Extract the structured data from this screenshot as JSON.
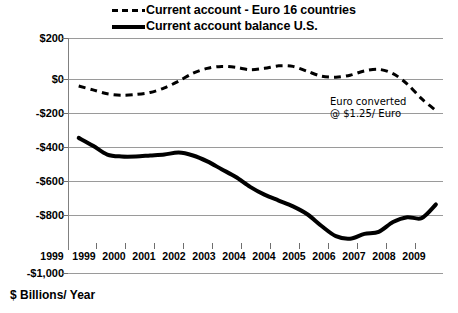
{
  "legend": {
    "items": [
      {
        "label": "Current account - Euro 16 countries",
        "marker": "dashed-line-icon"
      },
      {
        "label": "Current account balance U.S.",
        "marker": "solid-line-icon"
      }
    ]
  },
  "annotation": {
    "line1": "Euro converted",
    "line2": "@ $1.25/ Euro"
  },
  "footer_label": "$ Billions/ Year",
  "axis": {
    "y_ticks": [
      "$200",
      "$0",
      "-$200",
      "-$400",
      "-$600",
      "-$800",
      "-$1,000"
    ],
    "x_ticks": [
      "1999",
      "1999",
      "2000",
      "2001",
      "2002",
      "2003",
      "2004",
      "2004",
      "2005",
      "2006",
      "2007",
      "2008",
      "2009"
    ]
  },
  "colors": {
    "line": "#000000",
    "grid": "#9a9a9a",
    "background": "#ffffff"
  },
  "chart_data": {
    "type": "line",
    "title": "",
    "subtitle": "",
    "xlabel": "",
    "ylabel": "$ Billions/ Year",
    "ylim": [
      -1000,
      200
    ],
    "yticks": [
      200,
      0,
      -200,
      -400,
      -600,
      -800,
      -1000
    ],
    "xlim": [
      1999,
      2009.5
    ],
    "xtick_labels": [
      "1999",
      "1999",
      "2000",
      "2001",
      "2002",
      "2003",
      "2004",
      "2004",
      "2005",
      "2006",
      "2007",
      "2008",
      "2009"
    ],
    "grid": true,
    "legend_position": "top",
    "annotations": [
      {
        "text": "Euro converted @ $1.25/ Euro",
        "x": 2007.2,
        "y": -120
      }
    ],
    "series": [
      {
        "name": "Current account - Euro 16 countries",
        "style": "dashed",
        "x": [
          1999.3,
          1999.7,
          2000.1,
          2000.5,
          2000.9,
          2001.3,
          2001.7,
          2002.1,
          2002.5,
          2002.9,
          2003.3,
          2003.7,
          2004.1,
          2004.5,
          2004.9,
          2005.3,
          2005.7,
          2006.1,
          2006.5,
          2006.9,
          2007.3,
          2007.7,
          2008.1,
          2008.5,
          2008.9,
          2009.3
        ],
        "values": [
          -45,
          -65,
          -85,
          -92,
          -88,
          -78,
          -55,
          -20,
          20,
          45,
          55,
          50,
          38,
          45,
          58,
          55,
          30,
          5,
          0,
          10,
          32,
          40,
          18,
          -35,
          -110,
          -170
        ]
      },
      {
        "name": "Current account balance U.S.",
        "style": "solid",
        "x": [
          1999.3,
          1999.7,
          2000.1,
          2000.5,
          2000.9,
          2001.3,
          2001.7,
          2002.1,
          2002.5,
          2002.9,
          2003.3,
          2003.7,
          2004.1,
          2004.5,
          2004.9,
          2005.3,
          2005.7,
          2006.1,
          2006.5,
          2006.9,
          2007.3,
          2007.7,
          2008.1,
          2008.5,
          2008.9,
          2009.3
        ],
        "values": [
          -310,
          -350,
          -395,
          -405,
          -405,
          -400,
          -395,
          -385,
          -400,
          -430,
          -470,
          -510,
          -560,
          -600,
          -630,
          -660,
          -700,
          -760,
          -812,
          -825,
          -800,
          -790,
          -740,
          -715,
          -720,
          -650
        ]
      }
    ]
  }
}
